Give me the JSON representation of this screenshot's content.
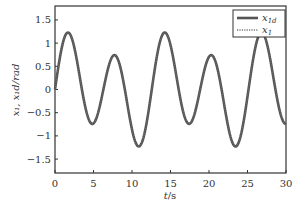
{
  "chart_data": {
    "type": "line",
    "title": "",
    "xlabel": "t/s",
    "ylabel": "x1, x1d/rad",
    "xlim": [
      0,
      30
    ],
    "ylim": [
      -1.8,
      1.8
    ],
    "xticks": [
      0,
      5,
      10,
      15,
      20,
      25,
      30
    ],
    "yticks": [
      1.5,
      1,
      0.5,
      0,
      -0.5,
      -1,
      -1.5
    ],
    "ytick_labels": [
      "1.5",
      "1",
      "0.5",
      "0",
      "−0.5",
      "−1",
      "−1.5"
    ],
    "grid": false,
    "legend_position": "upper right",
    "series": [
      {
        "name": "x1d",
        "style": "solid",
        "color": "#555555",
        "x": [
          0,
          1,
          2,
          3,
          4,
          5,
          6,
          7,
          7.7,
          9,
          10,
          11,
          12,
          13,
          14.2,
          15,
          16,
          17.5,
          19,
          20.3,
          22,
          23.5,
          25,
          27,
          28,
          29,
          30
        ],
        "y": [
          0,
          0.85,
          1.1,
          0.6,
          -0.2,
          -0.55,
          -0.2,
          0.4,
          0.5,
          0.0,
          -0.75,
          -1.15,
          -0.7,
          0.3,
          1.1,
          0.85,
          0.0,
          -0.55,
          -0.1,
          0.5,
          -0.2,
          -1.15,
          -0.4,
          1.05,
          0.6,
          -0.1,
          -0.6
        ]
      },
      {
        "name": "x1",
        "style": "dotted",
        "color": "#777777",
        "x": [
          0,
          1,
          2,
          3,
          4,
          5,
          6,
          7,
          7.7,
          9,
          10,
          11,
          12,
          13,
          14.2,
          15,
          16,
          17.5,
          19,
          20.3,
          22,
          23.5,
          25,
          27,
          28,
          29,
          30
        ],
        "y": [
          0,
          0.85,
          1.1,
          0.6,
          -0.2,
          -0.55,
          -0.2,
          0.4,
          0.5,
          0.0,
          -0.75,
          -1.15,
          -0.7,
          0.3,
          1.1,
          0.85,
          0.0,
          -0.55,
          -0.1,
          0.5,
          -0.2,
          -1.15,
          -0.4,
          1.05,
          0.6,
          -0.1,
          -0.6
        ]
      }
    ],
    "model": {
      "a": 0.85,
      "w1": 1.0,
      "b": 0.3,
      "w2": 0.5
    }
  },
  "legend": {
    "items": [
      {
        "label": "x",
        "sub": "1d",
        "style": "solid"
      },
      {
        "label": "x",
        "sub": "1",
        "style": "dotted"
      }
    ]
  },
  "axes": {
    "xlabel_t": "t",
    "xlabel_unit": "/s",
    "ylabel_text": "x₁, x₁d/rad"
  }
}
